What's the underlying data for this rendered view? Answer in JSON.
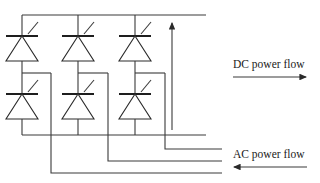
{
  "diagram": {
    "type": "three-phase thyristor bridge converter",
    "labels": {
      "dc_flow": "DC power flow",
      "ac_flow": "AC power flow"
    },
    "colors": {
      "line": "#3a3a3a",
      "background": "#ffffff"
    },
    "legs": [
      {
        "id": "leg-1",
        "x": 22,
        "mid_x": 51,
        "phase_y": 173
      },
      {
        "id": "leg-2",
        "x": 78,
        "mid_x": 108,
        "phase_y": 161
      },
      {
        "id": "leg-3",
        "x": 135,
        "mid_x": 165,
        "phase_y": 149
      }
    ],
    "arrows": [
      {
        "name": "dc-output-arrow",
        "direction": "up"
      },
      {
        "name": "dc-power-flow-arrow",
        "direction": "right"
      },
      {
        "name": "ac-power-flow-arrow",
        "direction": "left"
      }
    ]
  }
}
